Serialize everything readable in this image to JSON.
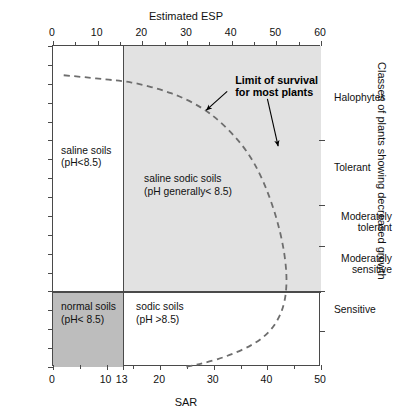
{
  "chart_data": {
    "type": "line",
    "title": "",
    "xlabel": "SAR",
    "ylabel": "EC (dS m⁻¹)",
    "x2label": "Estimated ESP",
    "y2label": "Classes of plants showing decreased growth",
    "xlim": [
      0,
      50
    ],
    "ylim": [
      0,
      17
    ],
    "x2lim": [
      0,
      60
    ],
    "grid": false,
    "legend": null,
    "x_ticks": [
      0,
      10,
      13,
      20,
      30,
      40,
      50
    ],
    "x_tick_labels": [
      "0",
      "10",
      "13",
      "20",
      "30",
      "40",
      "50"
    ],
    "x_minor_ticks": [
      5,
      15,
      25,
      35,
      45
    ],
    "x2_ticks": [
      0,
      10,
      20,
      30,
      40,
      50,
      60
    ],
    "x2_tick_labels": [
      "0",
      "10",
      "20",
      "30",
      "40",
      "50",
      "60"
    ],
    "x2_minor_ticks": [
      5,
      15,
      25,
      35,
      45,
      55
    ],
    "y_ticks": [
      0,
      1,
      2,
      3,
      4,
      5,
      6,
      7,
      8,
      9,
      10,
      11,
      12,
      13,
      14,
      15,
      16,
      17
    ],
    "y_tick_labels": [
      "0",
      "1",
      "2",
      "3",
      "4",
      "5",
      "6",
      "7",
      "8",
      "9",
      "10",
      "11",
      "12",
      "13",
      "14",
      "15",
      "16",
      "17"
    ],
    "series": [
      {
        "name": "Limit of survival for most plants",
        "style": "dashed",
        "color": "#6e6e6e",
        "points": [
          [
            2.0,
            15.45
          ],
          [
            6.0,
            15.35
          ],
          [
            10.0,
            15.22
          ],
          [
            13.0,
            15.15
          ],
          [
            16.0,
            15.0
          ],
          [
            20.0,
            14.7
          ],
          [
            24.0,
            14.3
          ],
          [
            28.0,
            13.7
          ],
          [
            31.0,
            13.05
          ],
          [
            34.0,
            12.2
          ],
          [
            36.5,
            11.3
          ],
          [
            38.5,
            10.3
          ],
          [
            40.3,
            9.1
          ],
          [
            41.8,
            7.8
          ],
          [
            42.9,
            6.5
          ],
          [
            43.5,
            5.3
          ],
          [
            43.6,
            4.3
          ],
          [
            43.2,
            3.4
          ],
          [
            42.2,
            2.6
          ],
          [
            40.4,
            1.85
          ],
          [
            37.5,
            1.2
          ],
          [
            33.0,
            0.62
          ],
          [
            28.5,
            0.22
          ],
          [
            24.6,
            0.0
          ]
        ]
      }
    ],
    "shaded_regions": [
      {
        "name": "saline-sodic-region",
        "color": "#e2e2e2",
        "x_range": [
          13,
          50
        ],
        "y_range": [
          4,
          17
        ]
      },
      {
        "name": "normal-soils-region",
        "color": "#bdbdbd",
        "x_range": [
          0,
          13
        ],
        "y_range": [
          0,
          4
        ]
      }
    ],
    "divider_lines": [
      {
        "name": "sar-13-line",
        "orientation": "vertical",
        "value": 13
      },
      {
        "name": "ec-4-line",
        "orientation": "horizontal",
        "value": 4
      }
    ],
    "region_labels": [
      {
        "id": "saline",
        "text": "saline soils\n(pH<8.5)",
        "x": 1.5,
        "y": 11.4
      },
      {
        "id": "saline_sodic",
        "text": "saline sodic soils\n(pH generally< 8.5)",
        "x": 17.0,
        "y": 9.9
      },
      {
        "id": "normal",
        "text": "normal soils\n(pH< 8.5)",
        "x": 1.5,
        "y": 3.1
      },
      {
        "id": "sodic",
        "text": "sodic soils\n(pH >8.5)",
        "x": 15.5,
        "y": 3.1
      }
    ],
    "annotations": [
      {
        "id": "limit-of-survival",
        "text": "Limit of survival\nfor most plants",
        "x": 34.0,
        "y": 15.2,
        "arrows": [
          {
            "from": [
              32.5,
              14.6
            ],
            "to": [
              28.6,
              13.6
            ]
          },
          {
            "from": [
              40.0,
              14.2
            ],
            "to": [
              42.0,
              11.7
            ]
          }
        ]
      }
    ],
    "right_axis_ticks": [
      12.0,
      8.6,
      6.4,
      4.0,
      1.9
    ],
    "right_axis_classes": [
      {
        "label": "Halophytes",
        "y_center": 14.2,
        "align": "left"
      },
      {
        "label": "Tolerant",
        "y_center": 10.5,
        "align": "left"
      },
      {
        "label": "Moderately\ntolerant",
        "y_center": 7.6,
        "align": "right"
      },
      {
        "label": "Moderately\nsensitive",
        "y_center": 5.4,
        "align": "right"
      },
      {
        "label": "Sensitive",
        "y_center": 3.0,
        "align": "left"
      }
    ]
  },
  "axis_titles": {
    "bottom": "SAR",
    "left": "EC (dS m⁻¹)",
    "top": "Estimated ESP",
    "right": "Classes of plants showing decreased growth"
  },
  "colors": {
    "shade_light": "#e2e2e2",
    "shade_dark": "#bdbdbd",
    "axis": "#4a4a4a",
    "curve": "#6e6e6e",
    "text": "#111111"
  }
}
